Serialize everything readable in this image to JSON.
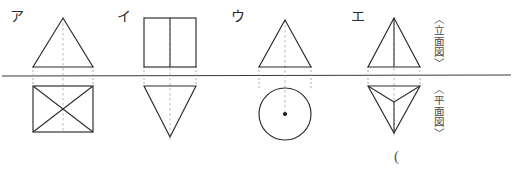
{
  "sheet": {
    "width": 513,
    "height": 175,
    "background_color": "#ffffff",
    "line_color": "#2b2b2b",
    "construction_line_color": "#9a9a9a",
    "ground_line_color": "#3a3a3a"
  },
  "view_labels": {
    "elevation": "〈立面図〉",
    "plan": "〈平面図〉"
  },
  "figures": [
    {
      "key": "a",
      "label": "ア",
      "elevation_shape": "triangle",
      "plan_shape": "square-with-diagonals",
      "solid_name": "square-pyramid",
      "center_x": 63,
      "half_width": 30
    },
    {
      "key": "i",
      "label": "イ",
      "elevation_shape": "rectangle-with-center-line",
      "plan_shape": "inverted-triangle",
      "solid_name": "triangular-prism",
      "center_x": 170,
      "half_width": 26
    },
    {
      "key": "u",
      "label": "ウ",
      "elevation_shape": "triangle",
      "plan_shape": "circle-with-center-dot",
      "solid_name": "cone",
      "center_x": 285,
      "half_width": 26
    },
    {
      "key": "e",
      "label": "エ",
      "elevation_shape": "triangle-with-center-line",
      "plan_shape": "inverted-triangle-with-radials",
      "solid_name": "triangular-pyramid",
      "center_x": 394,
      "half_width": 26
    }
  ],
  "stray_marks": [
    {
      "text": "(",
      "x": 394,
      "y": 150
    }
  ]
}
